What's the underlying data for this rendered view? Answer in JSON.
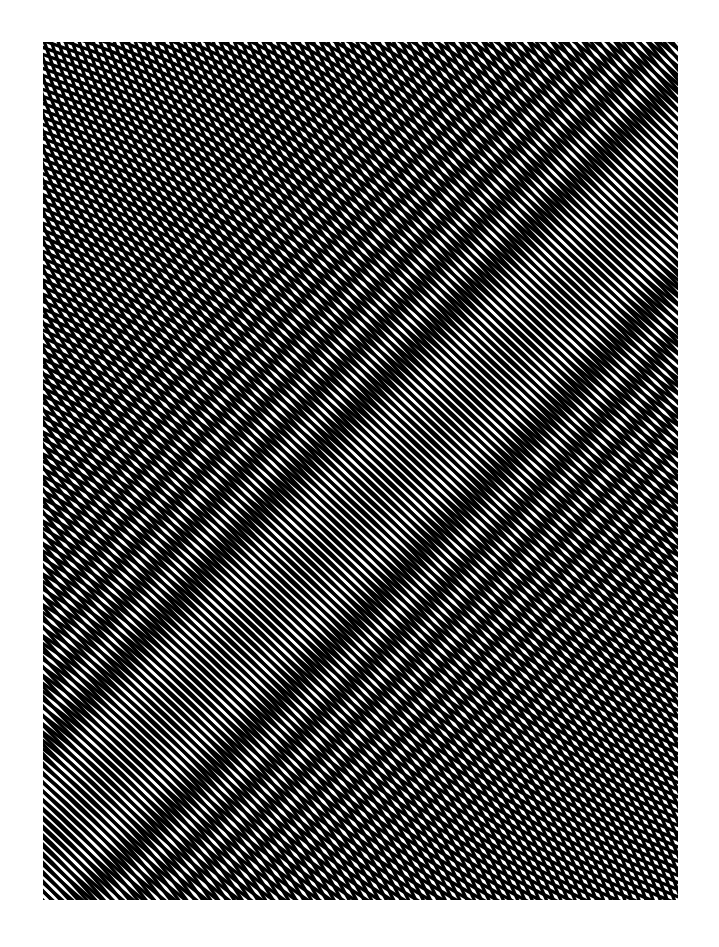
{
  "artwork": {
    "title": "",
    "frame": {
      "x": 43,
      "y": 42,
      "width": 635,
      "height": 858
    },
    "background_color": "#ffffff",
    "ink_color": "#000000",
    "page_color": "#ffffff",
    "pattern": {
      "type": "moire-concentric-circles",
      "period_px": 6.6,
      "stroke_px": 3.3,
      "families": [
        {
          "name": "family-a",
          "center_x": -420,
          "center_y": 1250
        },
        {
          "name": "family-b",
          "center_x": 1120,
          "center_y": -380
        }
      ]
    }
  }
}
